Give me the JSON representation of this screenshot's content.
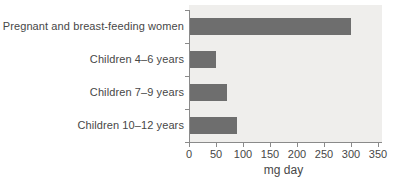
{
  "chart_data": {
    "type": "bar",
    "orientation": "horizontal",
    "categories": [
      "Pregnant and breast-feeding women",
      "Children 4–6 years",
      "Children 7–9 years",
      "Children 10–12 years"
    ],
    "values": [
      300,
      50,
      70,
      90
    ],
    "title": "",
    "xlabel": "mg day",
    "ylabel": "",
    "xlim": [
      0,
      350
    ],
    "xticks": [
      0,
      50,
      100,
      150,
      200,
      250,
      300,
      350
    ],
    "grid": false,
    "legend": null,
    "colors": {
      "bar": "#6e6e6e",
      "plot_background": "#efeeec",
      "axis": "#8a8a8a",
      "text": "#474747"
    }
  }
}
